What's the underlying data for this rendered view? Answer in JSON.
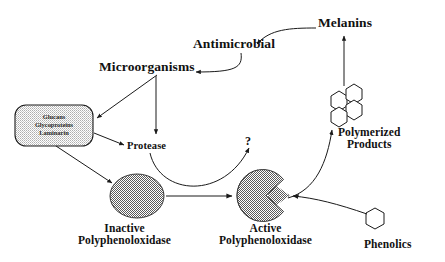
{
  "diagram": {
    "background_color": "#ffffff",
    "stroke_color": "#1a1a1a",
    "shape_fill_gray": "#8c8c8c",
    "box_fill_gray": "#d6d6d6",
    "nodes": {
      "microorganisms": {
        "label": "Microorganisms"
      },
      "antimicrobial": {
        "label": "Antimicrobial"
      },
      "melanins": {
        "label": "Melanins"
      },
      "protease": {
        "label": "Protease"
      },
      "unknown_step": {
        "label": "?"
      },
      "polymerized_products": {
        "label_line1": "Polymerized",
        "label_line2": "Products"
      },
      "phenolics": {
        "label": "Phenolics"
      },
      "inactive_ppo": {
        "label_line1": "Inactive",
        "label_line2": "Polyphenoloxidase"
      },
      "active_ppo": {
        "label_line1": "Active",
        "label_line2": "Polyphenoloxidase"
      },
      "cell_wall_box": {
        "line1": "Glucans",
        "line2": "Glycoproteins",
        "line3": "Laminarin"
      }
    }
  }
}
